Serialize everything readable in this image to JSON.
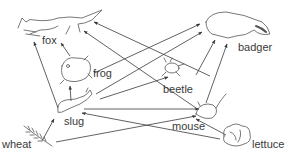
{
  "diagram": {
    "type": "food-web",
    "line_color": "#3a3a3a",
    "nodes": [
      {
        "id": "fox",
        "label": "fox",
        "icon": "fox-icon"
      },
      {
        "id": "badger",
        "label": "badger",
        "icon": "badger-icon"
      },
      {
        "id": "frog",
        "label": "frog",
        "icon": "frog-icon"
      },
      {
        "id": "beetle",
        "label": "beetle",
        "icon": "beetle-icon"
      },
      {
        "id": "slug",
        "label": "slug",
        "icon": "slug-icon"
      },
      {
        "id": "mouse",
        "label": "mouse",
        "icon": "mouse-icon"
      },
      {
        "id": "wheat",
        "label": "wheat",
        "icon": "wheat-icon"
      },
      {
        "id": "lettuce",
        "label": "lettuce",
        "icon": "lettuce-icon"
      }
    ],
    "edges": [
      {
        "from": "slug",
        "to": "fox"
      },
      {
        "from": "frog",
        "to": "fox"
      },
      {
        "from": "beetle",
        "to": "fox"
      },
      {
        "from": "mouse",
        "to": "fox"
      },
      {
        "from": "slug",
        "to": "frog"
      },
      {
        "from": "frog",
        "to": "badger"
      },
      {
        "from": "slug",
        "to": "badger"
      },
      {
        "from": "beetle",
        "to": "badger"
      },
      {
        "from": "mouse",
        "to": "badger"
      },
      {
        "from": "slug",
        "to": "beetle"
      },
      {
        "from": "slug",
        "to": "mouse"
      },
      {
        "from": "wheat",
        "to": "slug"
      },
      {
        "from": "wheat",
        "to": "mouse"
      },
      {
        "from": "lettuce",
        "to": "slug"
      },
      {
        "from": "lettuce",
        "to": "mouse"
      }
    ]
  }
}
